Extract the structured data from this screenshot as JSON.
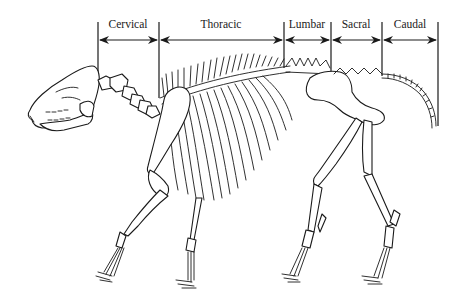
{
  "diagram": {
    "regions": [
      {
        "label": "Cervical",
        "x_start": 98,
        "x_end": 159
      },
      {
        "label": "Thoracic",
        "x_start": 159,
        "x_end": 284
      },
      {
        "label": "Lumbar",
        "x_start": 284,
        "x_end": 331
      },
      {
        "label": "Sacral",
        "x_start": 331,
        "x_end": 382
      },
      {
        "label": "Caudal",
        "x_start": 382,
        "x_end": 438
      }
    ],
    "dividers_x": [
      98,
      159,
      284,
      331,
      382,
      438
    ],
    "arrow_y": 40,
    "colors": {
      "ink": "#1a1a1a",
      "background": "#ffffff"
    }
  }
}
